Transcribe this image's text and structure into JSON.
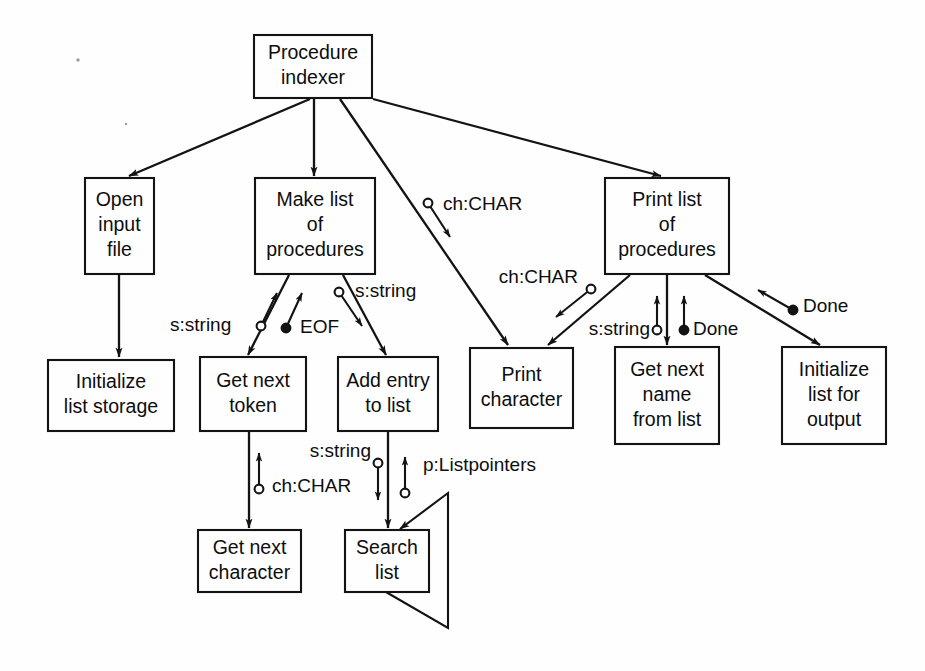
{
  "diagram": {
    "type": "structure-chart",
    "background_color": "#fefefe",
    "line_color": "#131313",
    "text_color": "#0d0d0d",
    "legend": {
      "data_couple": "hollow circle",
      "control_couple": "filled circle"
    },
    "modules": [
      {
        "id": "procedure-indexer",
        "lines": [
          "Procedure",
          "indexer"
        ],
        "x": 254,
        "y": 35,
        "w": 118,
        "h": 63
      },
      {
        "id": "open-input-file",
        "lines": [
          "Open",
          "input",
          "file"
        ],
        "x": 85,
        "y": 178,
        "w": 69,
        "h": 96
      },
      {
        "id": "make-list",
        "lines": [
          "Make list",
          "of",
          "procedures"
        ],
        "x": 255,
        "y": 178,
        "w": 120,
        "h": 96
      },
      {
        "id": "print-list",
        "lines": [
          "Print list",
          "of",
          "procedures"
        ],
        "x": 605,
        "y": 178,
        "w": 124,
        "h": 96
      },
      {
        "id": "initialize-storage",
        "lines": [
          "Initialize",
          "list storage"
        ],
        "x": 48,
        "y": 360,
        "w": 126,
        "h": 71
      },
      {
        "id": "get-next-token",
        "lines": [
          "Get next",
          "token"
        ],
        "x": 200,
        "y": 357,
        "w": 106,
        "h": 74
      },
      {
        "id": "add-entry-to-list",
        "lines": [
          "Add entry",
          "to list"
        ],
        "x": 338,
        "y": 357,
        "w": 100,
        "h": 74
      },
      {
        "id": "print-character",
        "lines": [
          "Print",
          "character"
        ],
        "x": 470,
        "y": 348,
        "w": 103,
        "h": 80
      },
      {
        "id": "get-next-name",
        "lines": [
          "Get next",
          "name",
          "from list"
        ],
        "x": 615,
        "y": 347,
        "w": 104,
        "h": 97
      },
      {
        "id": "initialize-output",
        "lines": [
          "Initialize",
          "list for",
          "output"
        ],
        "x": 782,
        "y": 347,
        "w": 104,
        "h": 97
      },
      {
        "id": "get-next-character",
        "lines": [
          "Get next",
          "character"
        ],
        "x": 198,
        "y": 530,
        "w": 103,
        "h": 62
      },
      {
        "id": "search-list",
        "lines": [
          "Search",
          "list"
        ],
        "x": 345,
        "y": 530,
        "w": 84,
        "h": 62
      }
    ],
    "calls": [
      {
        "id": "indexer-to-open-input-file",
        "from": "procedure-indexer",
        "to": "open-input-file",
        "x1": 310,
        "y1": 99,
        "x2": 129,
        "y2": 176
      },
      {
        "id": "indexer-to-make-list",
        "from": "procedure-indexer",
        "to": "make-list",
        "x1": 314,
        "y1": 99,
        "x2": 314,
        "y2": 176
      },
      {
        "id": "indexer-to-print-character",
        "from": "procedure-indexer",
        "to": "print-character",
        "x1": 340,
        "y1": 99,
        "x2": 508,
        "y2": 345
      },
      {
        "id": "indexer-to-print-list",
        "from": "procedure-indexer",
        "to": "print-list",
        "x1": 373,
        "y1": 99,
        "x2": 661,
        "y2": 176
      },
      {
        "id": "open-input-to-init-storage",
        "from": "open-input-file",
        "to": "initialize-storage",
        "x1": 119,
        "y1": 275,
        "x2": 119,
        "y2": 357
      },
      {
        "id": "make-list-to-get-token",
        "from": "make-list",
        "to": "get-next-token",
        "x1": 289,
        "y1": 275,
        "x2": 248,
        "y2": 355
      },
      {
        "id": "make-list-to-add-entry",
        "from": "make-list",
        "to": "add-entry-to-list",
        "x1": 343,
        "y1": 275,
        "x2": 386,
        "y2": 355
      },
      {
        "id": "print-list-to-print-char",
        "from": "print-list",
        "to": "print-character",
        "x1": 630,
        "y1": 275,
        "x2": 548,
        "y2": 345
      },
      {
        "id": "print-list-to-get-name",
        "from": "print-list",
        "to": "get-next-name",
        "x1": 667,
        "y1": 275,
        "x2": 667,
        "y2": 345
      },
      {
        "id": "print-list-to-init-output",
        "from": "print-list",
        "to": "initialize-output",
        "x1": 705,
        "y1": 275,
        "x2": 820,
        "y2": 345
      },
      {
        "id": "get-token-to-get-char",
        "from": "get-next-token",
        "to": "get-next-character",
        "x1": 249,
        "y1": 432,
        "x2": 249,
        "y2": 528
      },
      {
        "id": "add-entry-to-search-list",
        "from": "add-entry-to-list",
        "to": "search-list",
        "x1": 388,
        "y1": 432,
        "x2": 388,
        "y2": 528
      }
    ],
    "couples": [
      {
        "id": "couple-s-string-get-token",
        "label": "s:string",
        "kind": "data",
        "label_x": 170,
        "label_y": 326,
        "label_anchor": "start",
        "cx": 261,
        "cy": 326,
        "ax": 277,
        "ay": 293,
        "dir": "up"
      },
      {
        "id": "couple-eof-get-token",
        "label": "EOF",
        "kind": "control",
        "label_x": 300,
        "label_y": 328,
        "label_anchor": "start",
        "cx": 286,
        "cy": 328,
        "ax": 302,
        "ay": 293,
        "dir": "up"
      },
      {
        "id": "couple-s-string-add-entry",
        "label": "s:string",
        "kind": "data",
        "label_x": 355,
        "label_y": 292,
        "label_anchor": "start",
        "cx": 339,
        "cy": 292,
        "ax": 362,
        "ay": 326,
        "dir": "down"
      },
      {
        "id": "couple-ch-char-print-char",
        "label": "ch:CHAR",
        "kind": "data",
        "label_x": 443,
        "label_y": 205,
        "label_anchor": "start",
        "cx": 428,
        "cy": 203,
        "ax": 450,
        "ay": 237,
        "dir": "down"
      },
      {
        "id": "couple-ch-char-print-list",
        "label": "ch:CHAR",
        "kind": "data",
        "label_x": 578,
        "label_y": 278,
        "label_anchor": "end",
        "cx": 591,
        "cy": 289,
        "ax": 556,
        "ay": 317,
        "dir": "down-left"
      },
      {
        "id": "couple-s-string-get-name",
        "label": "s:string",
        "kind": "data",
        "label_x": 650,
        "label_y": 330,
        "label_anchor": "end",
        "cx": 657,
        "cy": 330,
        "ax": 657,
        "ay": 296,
        "dir": "up"
      },
      {
        "id": "couple-done-get-name",
        "label": "Done",
        "kind": "control",
        "label_x": 693,
        "label_y": 330,
        "label_anchor": "start",
        "cx": 684,
        "cy": 330,
        "ax": 684,
        "ay": 296,
        "dir": "up"
      },
      {
        "id": "couple-done-init-output",
        "label": "Done",
        "kind": "control",
        "label_x": 803,
        "label_y": 307,
        "label_anchor": "start",
        "cx": 793,
        "cy": 310,
        "ax": 758,
        "ay": 290,
        "dir": "up-left"
      },
      {
        "id": "couple-ch-char-get-char",
        "label": "ch:CHAR",
        "kind": "data",
        "label_x": 272,
        "label_y": 487,
        "label_anchor": "start",
        "cx": 259,
        "cy": 489,
        "ax": 259,
        "ay": 453,
        "dir": "up"
      },
      {
        "id": "couple-s-string-search",
        "label": "s:string",
        "kind": "data",
        "label_x": 371,
        "label_y": 452,
        "label_anchor": "end",
        "cx": 378,
        "cy": 463,
        "ax": 378,
        "ay": 500,
        "dir": "down"
      },
      {
        "id": "couple-p-listpointers",
        "label": "p:Listpointers",
        "kind": "data",
        "label_x": 423,
        "label_y": 466,
        "label_anchor": "start",
        "cx": 405,
        "cy": 493,
        "ax": 405,
        "ay": 457,
        "dir": "up"
      }
    ],
    "recursion": {
      "id": "search-list-recursion",
      "module": "search-list",
      "points": "386,592 448,628 448,493 400,529"
    }
  }
}
